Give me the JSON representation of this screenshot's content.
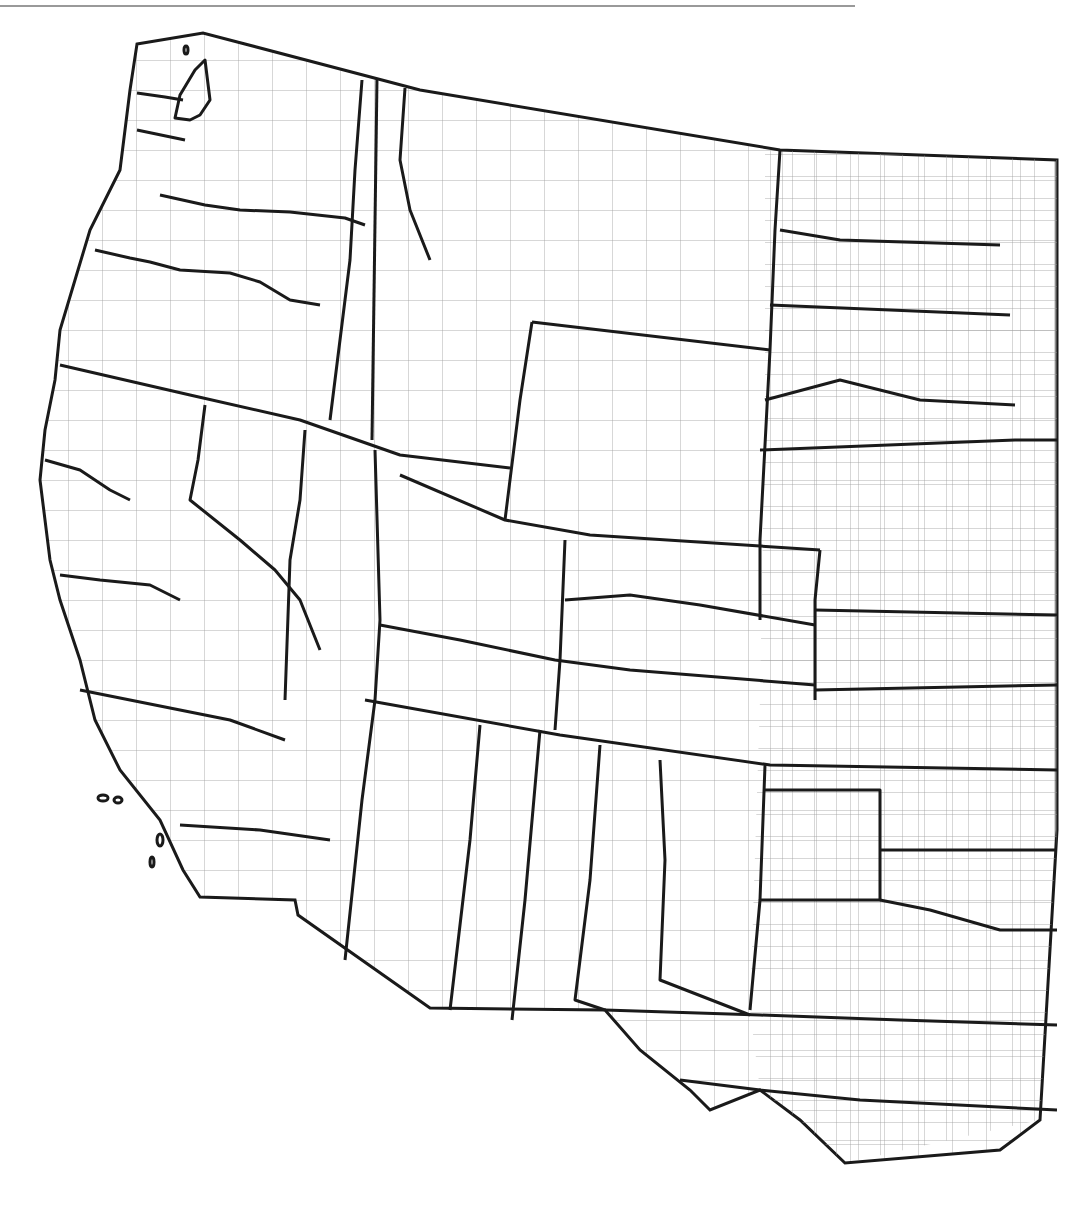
{
  "map": {
    "description": "Western United States outline map with county boundaries and bold regional boundaries",
    "colors": {
      "background": "#ffffff",
      "bold_line": "#1a1a1a",
      "county_line": "#9a9a9a",
      "top_rule": "#999999"
    },
    "labels": []
  }
}
